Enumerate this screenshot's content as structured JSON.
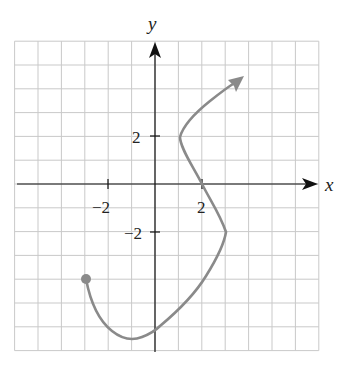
{
  "chart_data": {
    "type": "line",
    "title": "",
    "xlabel": "x",
    "ylabel": "y",
    "xlim": [
      -6,
      7
    ],
    "ylim": [
      -7,
      6
    ],
    "grid": true,
    "grid_step": 1,
    "x_tick_labels": [
      {
        "value": -2,
        "label": "−2"
      },
      {
        "value": 2,
        "label": "2"
      }
    ],
    "y_tick_labels": [
      {
        "value": 2,
        "label": "2"
      },
      {
        "value": -2,
        "label": "−2"
      }
    ],
    "series": [
      {
        "name": "curve",
        "color": "#8a8a8a",
        "start_marker": "closed-dot",
        "end_marker": "arrow",
        "points": [
          {
            "x": -3,
            "y": -4
          },
          {
            "x": -2.5,
            "y": -5.5
          },
          {
            "x": -1,
            "y": -6.5
          },
          {
            "x": 0,
            "y": -6
          },
          {
            "x": 2,
            "y": -4
          },
          {
            "x": 3,
            "y": -2
          },
          {
            "x": 2,
            "y": 0
          },
          {
            "x": 1,
            "y": 2
          },
          {
            "x": 2,
            "y": 3.2
          },
          {
            "x": 3.75,
            "y": 4.5
          }
        ]
      }
    ]
  },
  "labels": {
    "x_axis": "x",
    "y_axis": "y",
    "x_tick_neg2": "−2",
    "x_tick_2": "2",
    "y_tick_2": "2",
    "y_tick_neg2": "−2"
  },
  "colors": {
    "curve": "#8a8a8a",
    "grid": "#c9c9c9",
    "axes": "#111111"
  }
}
